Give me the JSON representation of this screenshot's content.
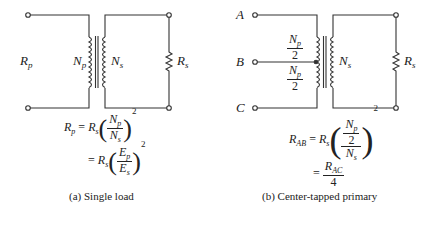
{
  "figure_a": {
    "caption": "(a) Single load",
    "labels": {
      "Rp": "R",
      "Rp_sub": "p",
      "Np": "N",
      "Np_sub": "p",
      "Ns": "N",
      "Ns_sub": "s",
      "Rs": "R",
      "Rs_sub": "s"
    },
    "equations": {
      "line1_lhs": "R",
      "line1_lhs_sub": "p",
      "eq_sign": "=",
      "rs": "R",
      "rs_sub": "s",
      "num1": "N",
      "num1_sub": "p",
      "den1": "N",
      "den1_sub": "s",
      "exp": "2",
      "num2": "E",
      "num2_sub": "p",
      "den2": "E",
      "den2_sub": "s"
    }
  },
  "figure_b": {
    "caption": "(b) Center-tapped primary",
    "terminals": [
      "A",
      "B",
      "C"
    ],
    "labels": {
      "Np_half_top_num": "N",
      "Np_half_top_sub": "p",
      "Np_half_top_den": "2",
      "Np_half_bot_num": "N",
      "Np_half_bot_sub": "p",
      "Np_half_bot_den": "2",
      "Ns": "N",
      "Ns_sub": "s",
      "Rs": "R",
      "Rs_sub": "s"
    },
    "equations": {
      "lhs": "R",
      "lhs_sub": "AB",
      "eq_sign": "=",
      "rs": "R",
      "rs_sub": "s",
      "inner_num": "N",
      "inner_num_sub": "p",
      "inner_den": "2",
      "outer_den": "N",
      "outer_den_sub": "s",
      "exp": "2",
      "rac": "R",
      "rac_sub": "AC",
      "rac_den": "4"
    }
  }
}
